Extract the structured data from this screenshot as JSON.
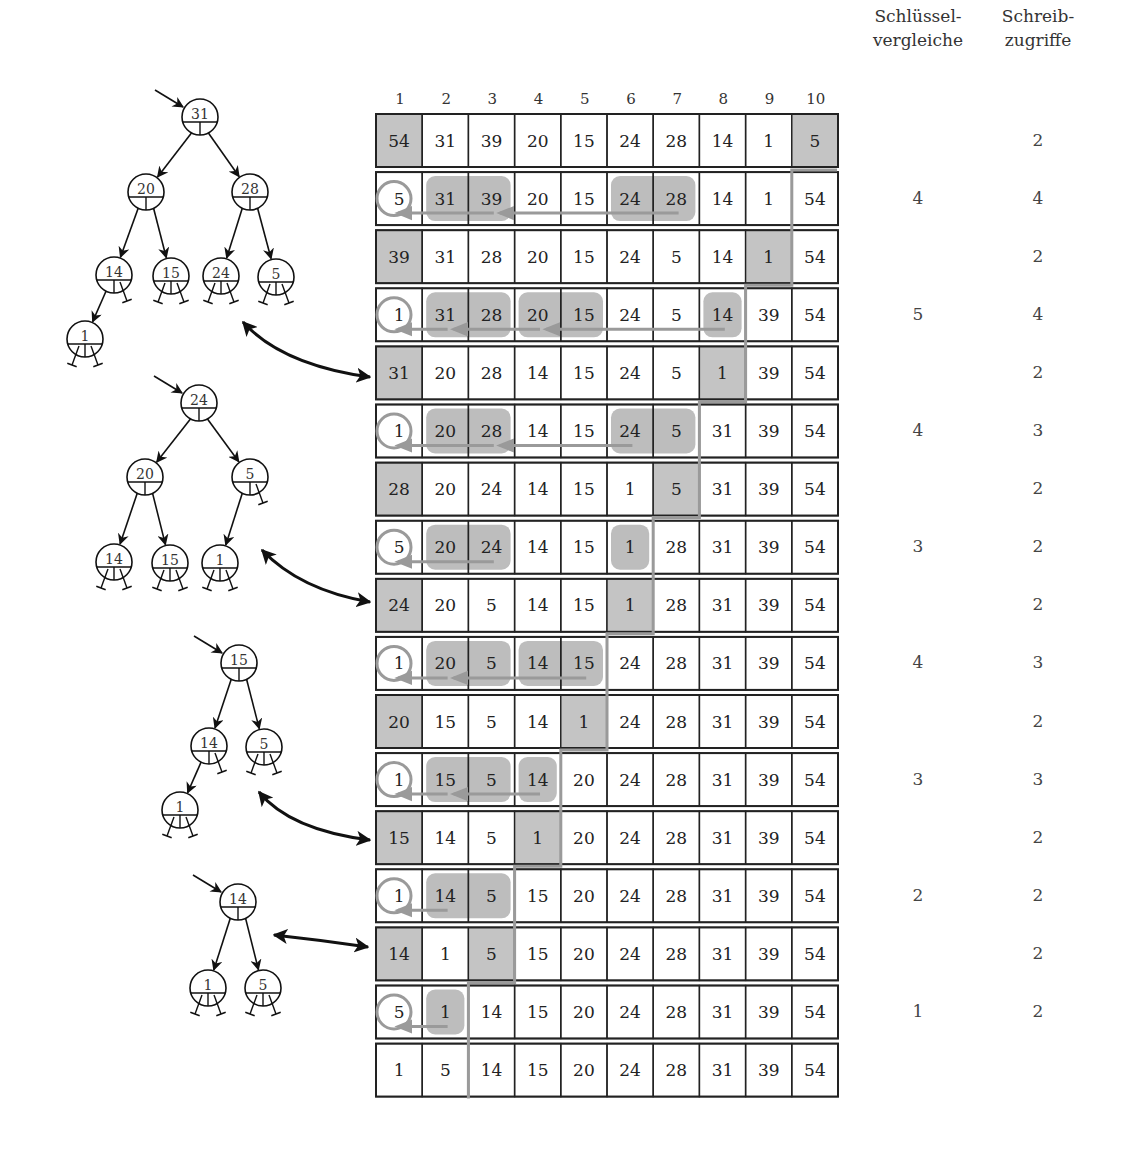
{
  "colors": {
    "cell_shade": "#c4c4c4",
    "highlight": "#bdbdbd",
    "path_gray": "#9a9a9a",
    "border": "#222222"
  },
  "column_indices": [
    "1",
    "2",
    "3",
    "4",
    "5",
    "6",
    "7",
    "8",
    "9",
    "10"
  ],
  "headers": {
    "comparisons": [
      "Schlüssel-",
      "vergleiche"
    ],
    "writes": [
      "Schreib-",
      "zugriffe"
    ]
  },
  "rows": [
    {
      "kind": "swap",
      "values": [
        "54",
        "31",
        "39",
        "20",
        "15",
        "24",
        "28",
        "14",
        "1",
        "5"
      ],
      "shaded": [
        0,
        9
      ],
      "comparisons": "",
      "writes": "2"
    },
    {
      "kind": "sift",
      "values": [
        "5",
        "31",
        "39",
        "20",
        "15",
        "24",
        "28",
        "14",
        "1",
        "54"
      ],
      "circle": 0,
      "highlights": [
        [
          1,
          2
        ],
        [
          5,
          6
        ]
      ],
      "arrows": [
        [
          2,
          0
        ],
        [
          6,
          2
        ]
      ],
      "comparisons": "4",
      "writes": "4"
    },
    {
      "kind": "swap",
      "values": [
        "39",
        "31",
        "28",
        "20",
        "15",
        "24",
        "5",
        "14",
        "1",
        "54"
      ],
      "shaded": [
        0,
        8
      ],
      "comparisons": "",
      "writes": "2"
    },
    {
      "kind": "sift",
      "values": [
        "1",
        "31",
        "28",
        "20",
        "15",
        "24",
        "5",
        "14",
        "39",
        "54"
      ],
      "circle": 0,
      "highlights": [
        [
          1,
          2
        ],
        [
          3,
          4
        ],
        [
          7,
          7
        ]
      ],
      "arrows": [
        [
          1,
          0
        ],
        [
          3,
          1
        ],
        [
          7,
          3
        ]
      ],
      "comparisons": "5",
      "writes": "4"
    },
    {
      "kind": "swap",
      "values": [
        "31",
        "20",
        "28",
        "14",
        "15",
        "24",
        "5",
        "1",
        "39",
        "54"
      ],
      "shaded": [
        0,
        7
      ],
      "comparisons": "",
      "writes": "2"
    },
    {
      "kind": "sift",
      "values": [
        "1",
        "20",
        "28",
        "14",
        "15",
        "24",
        "5",
        "31",
        "39",
        "54"
      ],
      "circle": 0,
      "highlights": [
        [
          1,
          2
        ],
        [
          5,
          6
        ]
      ],
      "arrows": [
        [
          2,
          0
        ],
        [
          5,
          2
        ]
      ],
      "comparisons": "4",
      "writes": "3"
    },
    {
      "kind": "swap",
      "values": [
        "28",
        "20",
        "24",
        "14",
        "15",
        "1",
        "5",
        "31",
        "39",
        "54"
      ],
      "shaded": [
        0,
        6
      ],
      "comparisons": "",
      "writes": "2"
    },
    {
      "kind": "sift",
      "values": [
        "5",
        "20",
        "24",
        "14",
        "15",
        "1",
        "28",
        "31",
        "39",
        "54"
      ],
      "circle": 0,
      "highlights": [
        [
          1,
          2
        ],
        [
          5,
          5
        ]
      ],
      "arrows": [
        [
          2,
          0
        ]
      ],
      "comparisons": "3",
      "writes": "2"
    },
    {
      "kind": "swap",
      "values": [
        "24",
        "20",
        "5",
        "14",
        "15",
        "1",
        "28",
        "31",
        "39",
        "54"
      ],
      "shaded": [
        0,
        5
      ],
      "comparisons": "",
      "writes": "2"
    },
    {
      "kind": "sift",
      "values": [
        "1",
        "20",
        "5",
        "14",
        "15",
        "24",
        "28",
        "31",
        "39",
        "54"
      ],
      "circle": 0,
      "highlights": [
        [
          1,
          2
        ],
        [
          3,
          4
        ]
      ],
      "arrows": [
        [
          1,
          0
        ],
        [
          4,
          1
        ]
      ],
      "comparisons": "4",
      "writes": "3"
    },
    {
      "kind": "swap",
      "values": [
        "20",
        "15",
        "5",
        "14",
        "1",
        "24",
        "28",
        "31",
        "39",
        "54"
      ],
      "shaded": [
        0,
        4
      ],
      "comparisons": "",
      "writes": "2"
    },
    {
      "kind": "sift",
      "values": [
        "1",
        "15",
        "5",
        "14",
        "20",
        "24",
        "28",
        "31",
        "39",
        "54"
      ],
      "circle": 0,
      "highlights": [
        [
          1,
          2
        ],
        [
          3,
          3
        ]
      ],
      "arrows": [
        [
          1,
          0
        ],
        [
          3,
          1
        ]
      ],
      "comparisons": "3",
      "writes": "3"
    },
    {
      "kind": "swap",
      "values": [
        "15",
        "14",
        "5",
        "1",
        "20",
        "24",
        "28",
        "31",
        "39",
        "54"
      ],
      "shaded": [
        0,
        3
      ],
      "comparisons": "",
      "writes": "2"
    },
    {
      "kind": "sift",
      "values": [
        "1",
        "14",
        "5",
        "15",
        "20",
        "24",
        "28",
        "31",
        "39",
        "54"
      ],
      "circle": 0,
      "highlights": [
        [
          1,
          2
        ]
      ],
      "arrows": [
        [
          1,
          0
        ]
      ],
      "comparisons": "2",
      "writes": "2"
    },
    {
      "kind": "swap",
      "values": [
        "14",
        "1",
        "5",
        "15",
        "20",
        "24",
        "28",
        "31",
        "39",
        "54"
      ],
      "shaded": [
        0,
        2
      ],
      "comparisons": "",
      "writes": "2"
    },
    {
      "kind": "sift",
      "values": [
        "5",
        "1",
        "14",
        "15",
        "20",
        "24",
        "28",
        "31",
        "39",
        "54"
      ],
      "circle": 0,
      "highlights": [
        [
          1,
          1
        ]
      ],
      "arrows": [
        [
          1,
          0
        ]
      ],
      "comparisons": "1",
      "writes": "2"
    },
    {
      "kind": "final",
      "values": [
        "1",
        "5",
        "14",
        "15",
        "20",
        "24",
        "28",
        "31",
        "39",
        "54"
      ],
      "comparisons": "",
      "writes": ""
    }
  ],
  "boundary_steps": [
    {
      "col": 9,
      "from_row": 1,
      "to_row": 2
    },
    {
      "col": 8,
      "from_row": 3,
      "to_row": 4
    },
    {
      "col": 7,
      "from_row": 5,
      "to_row": 6
    },
    {
      "col": 6,
      "from_row": 7,
      "to_row": 8
    },
    {
      "col": 5,
      "from_row": 9,
      "to_row": 10
    },
    {
      "col": 4,
      "from_row": 11,
      "to_row": 12
    },
    {
      "col": 3,
      "from_row": 13,
      "to_row": 14
    },
    {
      "col": 2,
      "from_row": 15,
      "to_row": 16
    }
  ],
  "trees": [
    {
      "name": "heap-tree-1",
      "nodes": [
        {
          "id": "a",
          "label": "31",
          "x": 200,
          "y": 117,
          "root": true
        },
        {
          "id": "b",
          "label": "20",
          "x": 146,
          "y": 192
        },
        {
          "id": "c",
          "label": "28",
          "x": 250,
          "y": 192
        },
        {
          "id": "d",
          "label": "14",
          "x": 114,
          "y": 275
        },
        {
          "id": "e",
          "label": "15",
          "x": 171,
          "y": 276
        },
        {
          "id": "f",
          "label": "24",
          "x": 221,
          "y": 276
        },
        {
          "id": "g",
          "label": "5",
          "x": 276,
          "y": 277
        },
        {
          "id": "h",
          "label": "1",
          "x": 85,
          "y": 339
        }
      ],
      "edges": [
        [
          "a",
          "b"
        ],
        [
          "a",
          "c"
        ],
        [
          "b",
          "d"
        ],
        [
          "b",
          "e"
        ],
        [
          "c",
          "f"
        ],
        [
          "c",
          "g"
        ],
        [
          "d",
          "h"
        ]
      ],
      "nil": {
        "d": [
          "r"
        ],
        "e": [
          "l",
          "r"
        ],
        "f": [
          "l",
          "r"
        ],
        "g": [
          "l",
          "r"
        ],
        "h": [
          "l",
          "r"
        ]
      }
    },
    {
      "name": "heap-tree-2",
      "nodes": [
        {
          "id": "a",
          "label": "24",
          "x": 199,
          "y": 403,
          "root": true
        },
        {
          "id": "b",
          "label": "20",
          "x": 145,
          "y": 477
        },
        {
          "id": "c",
          "label": "5",
          "x": 250,
          "y": 477
        },
        {
          "id": "d",
          "label": "14",
          "x": 114,
          "y": 562
        },
        {
          "id": "e",
          "label": "15",
          "x": 170,
          "y": 563
        },
        {
          "id": "f",
          "label": "1",
          "x": 220,
          "y": 563
        }
      ],
      "edges": [
        [
          "a",
          "b"
        ],
        [
          "a",
          "c"
        ],
        [
          "b",
          "d"
        ],
        [
          "b",
          "e"
        ],
        [
          "c",
          "f"
        ]
      ],
      "nil": {
        "c": [
          "r"
        ],
        "d": [
          "l",
          "r"
        ],
        "e": [
          "l",
          "r"
        ],
        "f": [
          "l",
          "r"
        ]
      }
    },
    {
      "name": "heap-tree-3",
      "nodes": [
        {
          "id": "a",
          "label": "15",
          "x": 239,
          "y": 663,
          "root": true
        },
        {
          "id": "b",
          "label": "14",
          "x": 209,
          "y": 746
        },
        {
          "id": "c",
          "label": "5",
          "x": 264,
          "y": 747
        },
        {
          "id": "d",
          "label": "1",
          "x": 180,
          "y": 810
        }
      ],
      "edges": [
        [
          "a",
          "b"
        ],
        [
          "a",
          "c"
        ],
        [
          "b",
          "d"
        ]
      ],
      "nil": {
        "b": [
          "r"
        ],
        "c": [
          "l",
          "r"
        ],
        "d": [
          "l",
          "r"
        ]
      }
    },
    {
      "name": "heap-tree-4",
      "nodes": [
        {
          "id": "a",
          "label": "14",
          "x": 238,
          "y": 902,
          "root": true
        },
        {
          "id": "b",
          "label": "1",
          "x": 208,
          "y": 988
        },
        {
          "id": "c",
          "label": "5",
          "x": 263,
          "y": 988
        }
      ],
      "edges": [
        [
          "a",
          "b"
        ],
        [
          "a",
          "c"
        ]
      ],
      "nil": {
        "b": [
          "l",
          "r"
        ],
        "c": [
          "l",
          "r"
        ]
      }
    }
  ],
  "link_arrows": [
    {
      "name": "link-arrow-tree1",
      "from": [
        243,
        322
      ],
      "to": [
        370,
        377
      ],
      "curve": [
        282,
        365
      ]
    },
    {
      "name": "link-arrow-tree2",
      "from": [
        262,
        550
      ],
      "to": [
        370,
        602
      ],
      "curve": [
        300,
        590
      ]
    },
    {
      "name": "link-arrow-tree3",
      "from": [
        259,
        792
      ],
      "to": [
        370,
        840
      ],
      "curve": [
        290,
        830
      ]
    },
    {
      "name": "link-arrow-tree4",
      "from": [
        274,
        935
      ],
      "to": [
        368,
        947
      ],
      "curve": [
        320,
        940
      ]
    }
  ]
}
